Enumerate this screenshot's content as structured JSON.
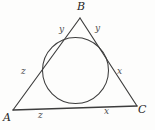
{
  "figure": {
    "type": "geometry-diagram",
    "stroke_color": "#3d3d3d",
    "background_color": "#fdfdfc",
    "vertices": [
      {
        "name": "B",
        "label": "B",
        "x": 80,
        "y": 18
      },
      {
        "name": "A",
        "label": "A",
        "x": 13,
        "y": 110
      },
      {
        "name": "C",
        "label": "C",
        "x": 137,
        "y": 106
      }
    ],
    "incircle": {
      "cx": 75.5,
      "cy": 70.5,
      "r": 33
    },
    "side_labels": [
      {
        "name": "y-left",
        "text": "y"
      },
      {
        "name": "y-right",
        "text": "y"
      },
      {
        "name": "z-left",
        "text": "z"
      },
      {
        "name": "z-bottom",
        "text": "z"
      },
      {
        "name": "x-right",
        "text": "x"
      },
      {
        "name": "x-bottom",
        "text": "x"
      }
    ]
  }
}
